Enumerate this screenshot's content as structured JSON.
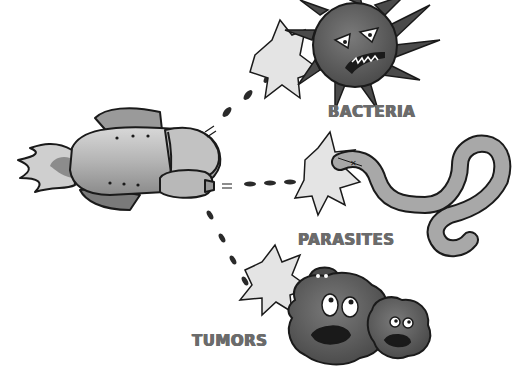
{
  "illustration": {
    "style": "grayscale cartoon",
    "background": "#ffffff",
    "ink_color": "#1a1a1a",
    "label_color": "#6b6b6b",
    "targets": [
      {
        "id": "bacteria",
        "label": "BACTERIA"
      },
      {
        "id": "parasites",
        "label": "PARASITES"
      },
      {
        "id": "tumors",
        "label": "TUMORS"
      }
    ],
    "elements": {
      "rocket": "rocket-ship-icon",
      "bacteria": "angry-spiky-bacterium-icon",
      "parasite": "worm-parasite-icon",
      "tumors": "scared-tumor-blobs-icon",
      "impact": "impact-burst-icon",
      "projectiles": "dotted-trajectory"
    }
  }
}
